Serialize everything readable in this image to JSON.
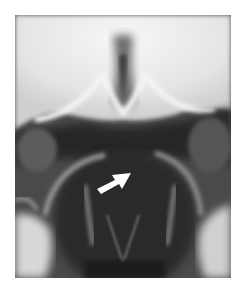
{
  "image": {
    "type": "radiograph",
    "modality": "X-ray",
    "palette": {
      "background": "#ffffff",
      "bone_bright": "#f2f2f2",
      "soft_mid": "#8a8a8a",
      "dark": "#1e1e1e",
      "arrow": "#ffffff"
    },
    "annotation": {
      "kind": "arrow",
      "color": "#ffffff",
      "direction": "up-right"
    }
  }
}
